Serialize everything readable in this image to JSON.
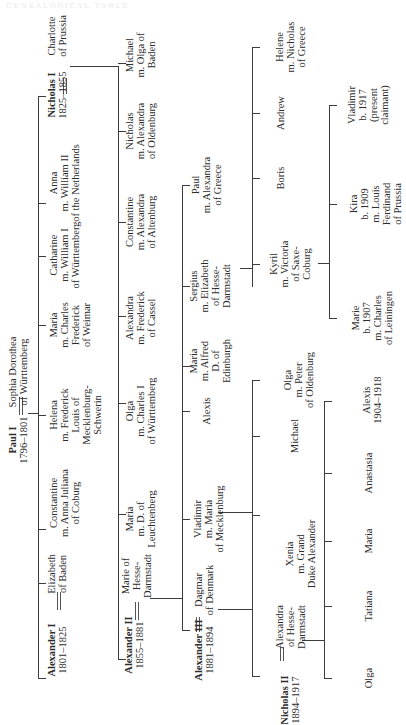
{
  "page": {
    "orientation": "rotated 90 degrees counter-clockwise",
    "ghost_text": "GENEALOGICAL TABLE"
  },
  "tree": {
    "root": {
      "name": "Paul I",
      "reign": "1796–1801",
      "spouse": [
        "Sophia Dorothea",
        "of Württemberg"
      ]
    },
    "gen1": [
      {
        "key": "alexander1",
        "lines": [
          "Alexander I",
          "1801–1825"
        ],
        "spouse": [
          "Elizabeth",
          "of Baden"
        ]
      },
      {
        "key": "constantine",
        "lines": [
          "Constantine",
          "m. Anna Juliana",
          "of Coburg"
        ]
      },
      {
        "key": "helena",
        "lines": [
          "Helena",
          "m. Frederick",
          "Louis of",
          "Mecklenburg-",
          "Schwerin"
        ]
      },
      {
        "key": "maria",
        "lines": [
          "Maria",
          "m. Charles",
          "Frederick",
          "of Weimar"
        ]
      },
      {
        "key": "catharine",
        "lines": [
          "Catharine",
          "m. William I",
          "of Württemberg"
        ]
      },
      {
        "key": "anna",
        "lines": [
          "Anna",
          "m. William II",
          "of the Netherlands"
        ]
      },
      {
        "key": "nicholas1",
        "lines": [
          "Nicholas I",
          "1825–1855"
        ],
        "spouse": [
          "Charlotte",
          "of Prussia"
        ]
      }
    ],
    "gen2": [
      {
        "key": "alexander2",
        "lines": [
          "Alexander II",
          "1855–1881"
        ],
        "spouse": [
          "Marie of",
          "Hesse-",
          "Darmstadt"
        ]
      },
      {
        "key": "maria",
        "lines": [
          "Maria",
          "m. D. of",
          "Leuchtenberg"
        ]
      },
      {
        "key": "olga",
        "lines": [
          "Olga",
          "m. Charles I",
          "of Württemberg"
        ]
      },
      {
        "key": "alexandra",
        "lines": [
          "Alexandra",
          "m. Frederick",
          "of Cassel"
        ]
      },
      {
        "key": "constantine",
        "lines": [
          "Constantine",
          "m. Alexandra",
          "of Altenburg"
        ]
      },
      {
        "key": "nicholas",
        "lines": [
          "Nicholas",
          "m. Alexandra",
          "of Oldenburg"
        ]
      },
      {
        "key": "michael",
        "lines": [
          "Michael",
          "m. Olga of",
          "Baden"
        ]
      }
    ],
    "gen3": [
      {
        "key": "alexander3",
        "lines": [
          "Alexander III",
          "1881–1894"
        ],
        "spouse": [
          "Dagmar",
          "of Denmark"
        ]
      },
      {
        "key": "vladimir",
        "lines": [
          "Vladimir",
          "m. Maria",
          "of Mecklenburg"
        ]
      },
      {
        "key": "alexis",
        "lines": [
          "Alexis"
        ]
      },
      {
        "key": "maria",
        "lines": [
          "Maria",
          "m. Alfred",
          "D. of",
          "Edinburgh"
        ]
      },
      {
        "key": "sergius",
        "lines": [
          "Sergius",
          "m. Elizabeth",
          "of Hesse-",
          "Darmstadt"
        ]
      },
      {
        "key": "paul",
        "lines": [
          "Paul",
          "m. Alexandra",
          "of Greece"
        ]
      }
    ],
    "gen4_alexander3": [
      {
        "key": "nicholas2",
        "lines": [
          "Nicholas II",
          "1894–1917"
        ],
        "spouse": [
          "Alexandra",
          "of Hesse-",
          "Darmstadt"
        ]
      },
      {
        "key": "xenia",
        "lines": [
          "Xenia",
          "m. Grand",
          "Duke Alexander"
        ]
      },
      {
        "key": "michael",
        "lines": [
          "Michael"
        ]
      },
      {
        "key": "olga",
        "lines": [
          "Olga",
          "m. Peter",
          "of Oldenburg"
        ]
      }
    ],
    "gen4_vladimir": [
      {
        "key": "kyril",
        "lines": [
          "Kyril",
          "m. Victoria",
          "of Saxe-",
          "Coburg"
        ]
      },
      {
        "key": "boris",
        "lines": [
          "Boris"
        ]
      },
      {
        "key": "andrew",
        "lines": [
          "Andrew"
        ]
      },
      {
        "key": "helene",
        "lines": [
          "Helene",
          "m. Nicholas",
          "of Greece"
        ]
      }
    ],
    "gen5_nicholas2": [
      {
        "key": "olga",
        "lines": [
          "Olga"
        ]
      },
      {
        "key": "tatiana",
        "lines": [
          "Tatiana"
        ]
      },
      {
        "key": "maria",
        "lines": [
          "Maria"
        ]
      },
      {
        "key": "anastasia",
        "lines": [
          "Anastasia"
        ]
      },
      {
        "key": "alexis",
        "lines": [
          "Alexis",
          "1904–1918"
        ]
      }
    ],
    "gen5_kyril": [
      {
        "key": "marie",
        "lines": [
          "Marie",
          "b. 1907",
          "m. Charles",
          "of Leiningen"
        ]
      },
      {
        "key": "kira",
        "lines": [
          "Kira",
          "b. 1909",
          "m. Louis",
          "Ferdinand",
          "of Prussia"
        ]
      },
      {
        "key": "vladimir",
        "lines": [
          "Vladimir",
          "b. 1917",
          "(present",
          "claimant)"
        ]
      }
    ]
  }
}
